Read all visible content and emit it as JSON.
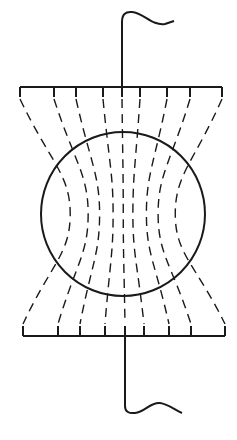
{
  "diagram": {
    "colors": {
      "stroke": "#1a1a1a",
      "background": "#ffffff"
    },
    "top_lead": {
      "x": 122,
      "y_top": 14,
      "y_bottom": 87
    },
    "bottom_lead": {
      "x": 125,
      "y_top": 336,
      "y_bottom": 412
    },
    "top_plate": {
      "x1": 20,
      "x2": 222,
      "y": 87
    },
    "bottom_plate": {
      "x1": 23,
      "x2": 225,
      "y": 336
    },
    "sphere": {
      "cx": 123,
      "cy": 214,
      "r": 82
    },
    "top_ticks_x": [
      20,
      54,
      76,
      103,
      122,
      140,
      167,
      190,
      222
    ],
    "bottom_ticks_x": [
      23,
      58,
      80,
      105,
      125,
      144,
      169,
      191,
      225
    ],
    "field_line_count": 9
  }
}
